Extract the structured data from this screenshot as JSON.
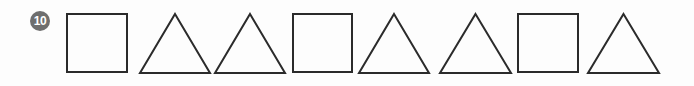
{
  "exercise": {
    "number_label": "10",
    "badge_color": "#6e6e6e",
    "badge_text_color": "#ffffff",
    "stroke_color": "#2b2b2b",
    "background_color": "#fdfdfd",
    "sequence_description": "square triangle triangle square triangle triangle square triangle"
  },
  "shapes": [
    {
      "index": 1,
      "type": "square",
      "icon": "square-outline-icon",
      "left": 66,
      "width": 62,
      "height": 60
    },
    {
      "index": 2,
      "type": "triangle",
      "icon": "triangle-outline-icon",
      "left": 139,
      "width": 72,
      "height": 61
    },
    {
      "index": 3,
      "type": "triangle",
      "icon": "triangle-outline-icon",
      "left": 214,
      "width": 72,
      "height": 61
    },
    {
      "index": 4,
      "type": "square",
      "icon": "square-outline-icon",
      "left": 292,
      "width": 61,
      "height": 60
    },
    {
      "index": 5,
      "type": "triangle",
      "icon": "triangle-outline-icon",
      "left": 358,
      "width": 72,
      "height": 61
    },
    {
      "index": 6,
      "type": "triangle",
      "icon": "triangle-outline-icon",
      "left": 439,
      "width": 73,
      "height": 61
    },
    {
      "index": 7,
      "type": "square",
      "icon": "square-outline-icon",
      "left": 517,
      "width": 62,
      "height": 60
    },
    {
      "index": 8,
      "type": "triangle",
      "icon": "triangle-outline-icon",
      "left": 587,
      "width": 73,
      "height": 61
    }
  ]
}
